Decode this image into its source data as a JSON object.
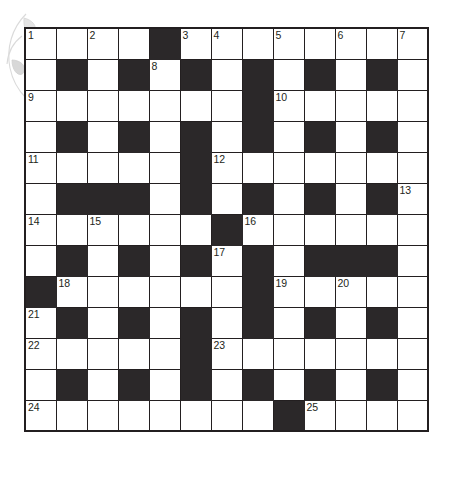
{
  "puzzle": {
    "title": "Crossword Grid",
    "type": "crossword",
    "columns": 13,
    "rows": 13,
    "colors": {
      "block": "#2b2829",
      "open": "#ffffff",
      "grid_line": "#231f20",
      "number_text": "#231f20",
      "page_background": "#ffffff",
      "decoration": "#b5b5b5"
    },
    "legend": {
      "block_char": "#",
      "open_char": "."
    },
    "grid": [
      "....#........",
      ".#.#.#.#.#.#.",
      ".......#.....",
      ".#.#.#.#.#.#.",
      ".....#.......",
      ".###.#.#.#.#.",
      "......#......",
      ".#.#.#.#.###.",
      "#......#.....",
      ".#.#.#.#.#.#.",
      ".....#.......",
      ".#.#.#.#.#.#.",
      "........#...."
    ],
    "numbers": [
      {
        "label": "1",
        "row": 1,
        "col": 1
      },
      {
        "label": "2",
        "row": 1,
        "col": 3
      },
      {
        "label": "3",
        "row": 1,
        "col": 6
      },
      {
        "label": "4",
        "row": 1,
        "col": 7
      },
      {
        "label": "5",
        "row": 1,
        "col": 9
      },
      {
        "label": "6",
        "row": 1,
        "col": 11
      },
      {
        "label": "7",
        "row": 1,
        "col": 13
      },
      {
        "label": "8",
        "row": 2,
        "col": 5
      },
      {
        "label": "9",
        "row": 3,
        "col": 1
      },
      {
        "label": "10",
        "row": 3,
        "col": 9
      },
      {
        "label": "11",
        "row": 5,
        "col": 1
      },
      {
        "label": "12",
        "row": 5,
        "col": 7
      },
      {
        "label": "13",
        "row": 6,
        "col": 13
      },
      {
        "label": "14",
        "row": 7,
        "col": 1
      },
      {
        "label": "15",
        "row": 7,
        "col": 3
      },
      {
        "label": "16",
        "row": 7,
        "col": 8
      },
      {
        "label": "17",
        "row": 8,
        "col": 7
      },
      {
        "label": "18",
        "row": 9,
        "col": 2
      },
      {
        "label": "19",
        "row": 9,
        "col": 9
      },
      {
        "label": "20",
        "row": 9,
        "col": 11
      },
      {
        "label": "21",
        "row": 10,
        "col": 1
      },
      {
        "label": "22",
        "row": 11,
        "col": 1
      },
      {
        "label": "23",
        "row": 11,
        "col": 7
      },
      {
        "label": "24",
        "row": 13,
        "col": 1
      },
      {
        "label": "25",
        "row": 13,
        "col": 10
      }
    ]
  }
}
